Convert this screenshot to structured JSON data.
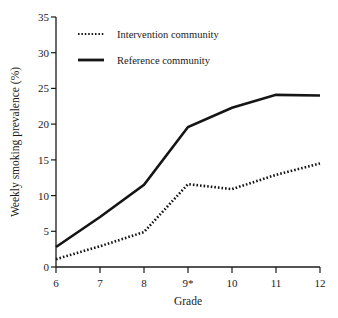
{
  "chart_data": {
    "type": "line",
    "title": "",
    "xlabel": "Grade",
    "ylabel": "Weekly smoking prevalence (%)",
    "x": [
      6,
      7,
      8,
      9,
      10,
      11,
      12
    ],
    "xtick_labels": [
      "6",
      "7",
      "8",
      "9*",
      "10",
      "11",
      "12"
    ],
    "ytick_labels": [
      "0",
      "5",
      "10",
      "15",
      "20",
      "25",
      "30",
      "35"
    ],
    "ytick_values": [
      0,
      5,
      10,
      15,
      20,
      25,
      30,
      35
    ],
    "xlim": [
      6,
      12
    ],
    "ylim": [
      0,
      35
    ],
    "grid": false,
    "legend_position": "top-left",
    "series": [
      {
        "name": "Intervention community",
        "style": "dotted",
        "color": "#151515",
        "values": [
          1.1,
          2.9,
          4.9,
          11.6,
          10.9,
          12.9,
          14.5
        ]
      },
      {
        "name": "Reference community",
        "style": "solid",
        "color": "#151515",
        "values": [
          2.8,
          7.0,
          11.5,
          19.6,
          22.3,
          24.1,
          24.0
        ]
      }
    ],
    "annotations": [
      "* Grade 9 marked with asterisk on x-axis"
    ]
  },
  "legend": {
    "items": [
      {
        "label": "Intervention community",
        "style": "dotted"
      },
      {
        "label": "Reference community",
        "style": "solid"
      }
    ]
  },
  "axes": {
    "x_title": "Grade",
    "y_title": "Weekly smoking prevalence (%)"
  }
}
